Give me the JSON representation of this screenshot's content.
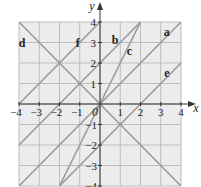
{
  "diagram": {
    "type": "coordinate-grid-lines",
    "x_axis": {
      "label": "x",
      "min": -4,
      "max": 4,
      "ticks": [
        "−4",
        "−3",
        "−2",
        "−1",
        "0",
        "1",
        "2",
        "3",
        "4"
      ]
    },
    "y_axis": {
      "label": "y",
      "min": -4,
      "max": 4,
      "ticks_positive": [
        "1",
        "2",
        "3",
        "4"
      ],
      "ticks_negative": [
        "−1",
        "−2",
        "−3",
        "−4"
      ]
    },
    "origin_label": "0",
    "colors": {
      "grid_bg": "#ececec",
      "grid_line": "#bdbdbd",
      "plot_line": "#9a9a9a",
      "axis": "#333333",
      "text": "#222222"
    },
    "lines": [
      {
        "label": "a",
        "equation": "y = x",
        "from": [
          -4,
          -4
        ],
        "to": [
          4,
          4
        ],
        "label_pos": [
          3.3,
          3.5
        ]
      },
      {
        "label": "b",
        "equation": "y = x + 2",
        "from": [
          -4,
          -2
        ],
        "to": [
          2,
          4
        ],
        "label_pos": [
          0.75,
          3.1
        ]
      },
      {
        "label": "c",
        "equation": "y = 2x",
        "from": [
          -2,
          -4
        ],
        "to": [
          2,
          4
        ],
        "label_pos": [
          1.45,
          2.6
        ]
      },
      {
        "label": "d",
        "equation": "y = −x",
        "from": [
          -4,
          4
        ],
        "to": [
          4,
          -4
        ],
        "label_pos": [
          -3.85,
          3.0
        ]
      },
      {
        "label": "e",
        "equation": "y = x − 2",
        "from": [
          -2,
          -4
        ],
        "to": [
          4,
          2
        ],
        "label_pos": [
          3.3,
          1.5
        ]
      },
      {
        "label": "f",
        "equation": "y = x + 4",
        "from": [
          -4,
          0
        ],
        "to": [
          0,
          4
        ],
        "label_pos": [
          -1.1,
          3.0
        ]
      }
    ]
  }
}
